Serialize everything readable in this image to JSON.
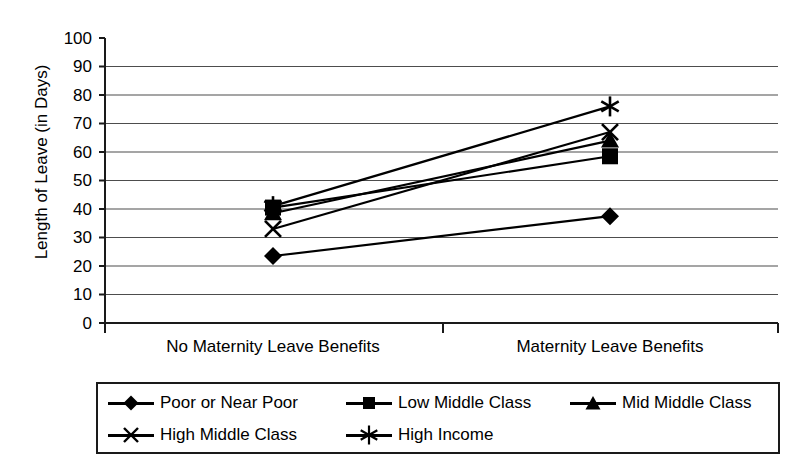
{
  "chart_data": {
    "type": "line",
    "title": "",
    "xlabel": "",
    "ylabel": "Length of Leave (in Days)",
    "categories": [
      "No Maternity Leave Benefits",
      "Maternity Leave Benefits"
    ],
    "ylim": [
      0,
      100
    ],
    "ytick_step": 10,
    "yticks": [
      "100",
      "90",
      "80",
      "70",
      "60",
      "50",
      "40",
      "30",
      "20",
      "10",
      "0"
    ],
    "grid": true,
    "legend_position": "bottom",
    "series": [
      {
        "name": "Poor or Near Poor",
        "marker": "diamond",
        "values": [
          23.5,
          37.5
        ]
      },
      {
        "name": "Low Middle Class",
        "marker": "square",
        "values": [
          40.5,
          58.5
        ]
      },
      {
        "name": "Mid Middle Class",
        "marker": "triangle",
        "values": [
          38.5,
          64.0
        ]
      },
      {
        "name": "High Middle Class",
        "marker": "x",
        "values": [
          33.0,
          67.0
        ]
      },
      {
        "name": "High Income",
        "marker": "asterisk",
        "values": [
          41.0,
          76.0
        ]
      }
    ],
    "colors": {
      "series": "#000000",
      "grid": "#4d4d4d",
      "axis": "#1a1a1a",
      "background": "#ffffff"
    }
  }
}
